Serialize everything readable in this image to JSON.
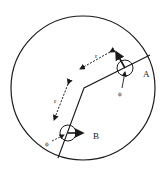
{
  "diagram": {
    "labels": {
      "point_a": "A",
      "point_b": "B",
      "r_upper": "r",
      "r_lower": "r",
      "phi_a": "ϕ",
      "phi_b": "ϕ"
    },
    "colors": {
      "stroke": "#1a1a1a",
      "background": "#ffffff"
    }
  }
}
